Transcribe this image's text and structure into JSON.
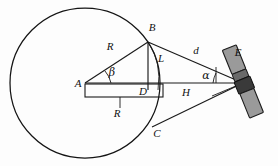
{
  "figure": {
    "type": "geometry-diagram",
    "background_color": "#fdfdfd",
    "ink_color": "#1a1a1a",
    "panel_color": "#9a9a9a",
    "body_color": "#3a3a3a"
  },
  "points": {
    "A": {
      "label": "A",
      "x": 85,
      "y": 83,
      "label_x": 78,
      "label_y": 87
    },
    "B": {
      "label": "B",
      "x": 148,
      "y": 42,
      "label_x": 152,
      "label_y": 31
    },
    "C": {
      "label": "C",
      "x": 152,
      "y": 127,
      "label_x": 157,
      "label_y": 137
    },
    "D": {
      "label": "D",
      "x": 148,
      "y": 83,
      "label_x": 143,
      "label_y": 95
    },
    "E": {
      "label": "E",
      "x": 243,
      "y": 83,
      "label_x": 238,
      "label_y": 56
    }
  },
  "segments": {
    "R_radius": {
      "label": "R",
      "label_x": 110,
      "label_y": 50
    },
    "R_baseline": {
      "label": "R",
      "label_x": 117,
      "label_y": 117
    },
    "L_vertical": {
      "label": "L",
      "label_x": 161,
      "label_y": 62
    },
    "d_slant": {
      "label": "d",
      "label_x": 196,
      "label_y": 54
    },
    "H_lower": {
      "label": "H",
      "label_x": 186,
      "label_y": 96
    }
  },
  "angles": {
    "beta": {
      "label": "β",
      "vertex": "A",
      "label_x": 112,
      "label_y": 76
    },
    "alpha": {
      "label": "α",
      "vertex": "E",
      "label_x": 206,
      "label_y": 79
    }
  },
  "circle": {
    "center_x": 85,
    "center_y": 83,
    "radius": 75
  },
  "satellite": {
    "name": "satellite-E",
    "tilt_degrees": -22,
    "panel_count": 2
  }
}
